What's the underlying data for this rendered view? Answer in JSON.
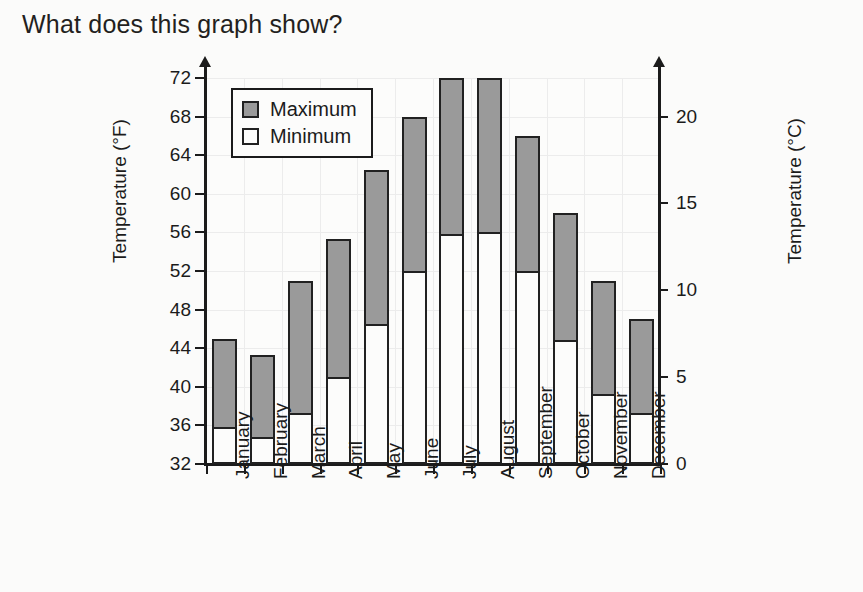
{
  "page": {
    "title": "What does this graph show?"
  },
  "chart_data": {
    "type": "bar",
    "subtype": "floating-range-bar",
    "title": "",
    "xlabel": "",
    "ylabel": "Temperature (°F)",
    "ylabel_secondary": "Temperature (°C)",
    "categories": [
      "January",
      "February",
      "March",
      "April",
      "May",
      "June",
      "July",
      "August",
      "September",
      "October",
      "November",
      "December"
    ],
    "series": [
      {
        "name": "Minimum",
        "values": [
          35.8,
          34.8,
          37.3,
          41.0,
          46.5,
          52.0,
          55.8,
          56.0,
          52.0,
          44.8,
          39.3,
          37.3
        ]
      },
      {
        "name": "Maximum",
        "values": [
          45.0,
          43.3,
          51.0,
          55.3,
          62.5,
          68.0,
          72.0,
          72.0,
          66.0,
          58.0,
          51.0,
          47.0
        ]
      }
    ],
    "ylim": [
      32,
      72
    ],
    "yticks": [
      32,
      36,
      40,
      44,
      48,
      52,
      56,
      60,
      64,
      68,
      72
    ],
    "ylim_secondary": [
      0,
      22.2
    ],
    "yticks_secondary": [
      0,
      5,
      10,
      15,
      20
    ],
    "grid": true,
    "legend_position": "upper-left",
    "legend": [
      {
        "label": "Maximum",
        "color": "#9a9a9a"
      },
      {
        "label": "Minimum",
        "color": "#fcfcfb"
      }
    ],
    "colors": {
      "maximum_fill": "#9a9a9a",
      "minimum_fill": "#fcfcfb",
      "outline": "#212121",
      "gridline": "#ececec",
      "background": "#fbfbfa"
    }
  }
}
